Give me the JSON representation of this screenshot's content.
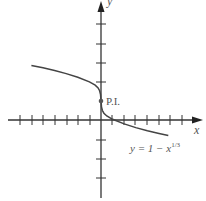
{
  "diagram": {
    "type": "function-graph",
    "axes": {
      "x_label": "x",
      "y_label": "y",
      "x_ticks_left": 7,
      "x_ticks_right": 7,
      "y_ticks_up": 4,
      "y_ticks_down": 3
    },
    "curve": {
      "equation_label": "y = 1 − x",
      "equation_exponent": "1/3",
      "x_range": [
        -6,
        5.8
      ]
    },
    "point": {
      "label": "P.I.",
      "x": 0,
      "y": 1,
      "meaning": "point of inflection"
    },
    "colors": {
      "axis": "#333333",
      "curve": "#444444",
      "label": "#666666"
    }
  }
}
